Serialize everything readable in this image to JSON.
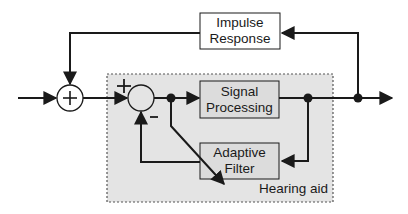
{
  "diagram": {
    "colors": {
      "line": "#1a1a1a",
      "box_fill": "#dcdcdc",
      "region_fill": "#e4e4e4",
      "region_border": "#555555",
      "background": "#ffffff"
    },
    "region": {
      "label": "Hearing aid"
    },
    "blocks": {
      "impulse_response": {
        "line1": "Impulse",
        "line2": "Response"
      },
      "signal_processing": {
        "line1": "Signal",
        "line2": "Processing"
      },
      "adaptive_filter": {
        "line1": "Adaptive",
        "line2": "Filter"
      }
    },
    "summers": {
      "acoustic_sum": {
        "symbol": "+"
      },
      "canceller": {
        "plus_sign": "+",
        "minus_sign": "−"
      }
    }
  }
}
